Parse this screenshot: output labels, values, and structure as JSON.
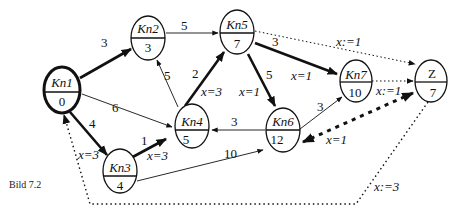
{
  "caption": "Bild 7.2",
  "nodes": [
    {
      "id": "Kn1",
      "name": "Kn1",
      "value": "0",
      "start": true
    },
    {
      "id": "Kn2",
      "name": "Kn2",
      "value": "3"
    },
    {
      "id": "Kn3",
      "name": "Kn3",
      "value": "4"
    },
    {
      "id": "Kn4",
      "name": "Kn4",
      "value": "5"
    },
    {
      "id": "Kn5",
      "name": "Kn5",
      "value": "7"
    },
    {
      "id": "Kn6",
      "name": "Kn6",
      "value": "12"
    },
    {
      "id": "Kn7",
      "name": "Kn7",
      "value": "10"
    },
    {
      "id": "Z",
      "name": "Z",
      "value": "7"
    }
  ],
  "edges": {
    "kn1_kn2": {
      "weight": "3",
      "style": "thick"
    },
    "kn1_kn4": {
      "weight": "6",
      "style": "thin"
    },
    "kn1_kn3": {
      "weight": "4",
      "flow": "x=3",
      "style": "thick"
    },
    "kn2_kn5": {
      "weight": "5",
      "style": "thin"
    },
    "kn4_kn2": {
      "weight": "5",
      "style": "thin"
    },
    "kn4_kn5": {
      "weight": "2",
      "flow": "x=3",
      "style": "thick"
    },
    "kn3_kn4": {
      "weight": "1",
      "flow": "x=3",
      "style": "thick"
    },
    "kn3_kn6": {
      "weight": "10",
      "style": "thin"
    },
    "kn5_kn6": {
      "weight": "5",
      "flow": "x=1",
      "style": "thick"
    },
    "kn5_kn7": {
      "weight": "3",
      "flow": "x=1",
      "style": "thick"
    },
    "kn6_kn4": {
      "weight": "3",
      "style": "thin"
    },
    "kn6_kn7": {
      "weight": "3",
      "style": "thin"
    },
    "kn5_z": {
      "flow": "x:=1",
      "style": "dotted"
    },
    "kn7_z": {
      "flow": "x:=1",
      "style": "dotted"
    },
    "z_kn6": {
      "flow": "x=1",
      "style": "dashed-thick"
    },
    "z_kn1": {
      "flow": "x:=3",
      "style": "dotted"
    }
  }
}
